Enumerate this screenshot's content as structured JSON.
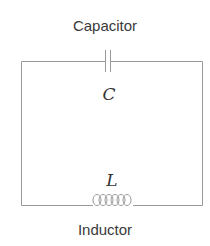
{
  "diagram": {
    "type": "LC circuit",
    "capacitor": {
      "label": "Capacitor",
      "symbol": "C"
    },
    "inductor": {
      "label": "Inductor",
      "symbol": "L"
    },
    "colors": {
      "wire": "#9a9a9a",
      "text": "#3a3a3a"
    }
  }
}
